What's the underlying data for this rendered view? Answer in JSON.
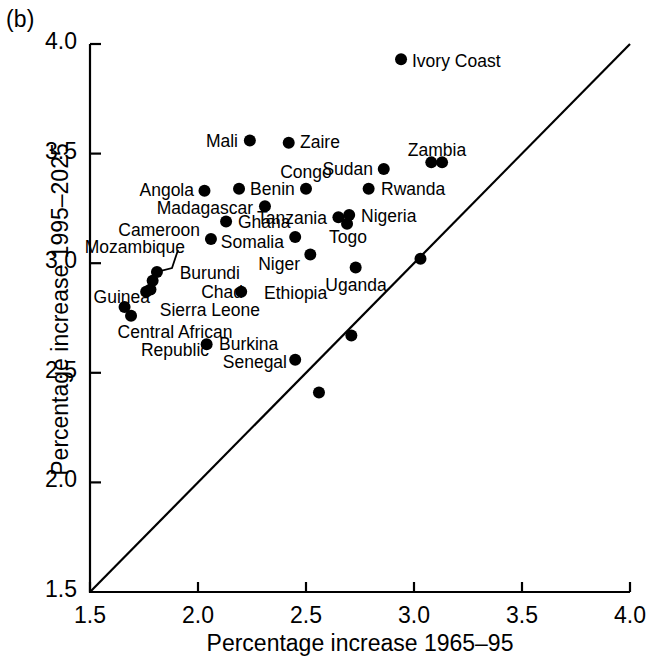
{
  "figure": {
    "panel_tag": "(b)",
    "xlabel": "Percentage increase 1965–95",
    "ylabel": "Percentage increase 1995–2025",
    "line_note": "1:1 diagonal reference line"
  },
  "axes": {
    "x_ticks": [
      "1.5",
      "2.0",
      "2.5",
      "3.0",
      "3.5",
      "4.0"
    ],
    "y_ticks": [
      "1.5",
      "2.0",
      "2.5",
      "3.0",
      "3.5",
      "4.0"
    ]
  },
  "chart_data": {
    "type": "scatter",
    "title": "",
    "xlabel": "Percentage increase 1965–95",
    "ylabel": "Percentage increase 1995–2025",
    "xlim": [
      1.5,
      4.0
    ],
    "ylim": [
      1.5,
      4.0
    ],
    "xticks": [
      1.5,
      2.0,
      2.5,
      3.0,
      3.5,
      4.0
    ],
    "yticks": [
      1.5,
      2.0,
      2.5,
      3.0,
      3.5,
      4.0
    ],
    "grid": false,
    "legend": "none",
    "reference_line": {
      "type": "identity",
      "from": [
        1.5,
        1.5
      ],
      "to": [
        4.0,
        4.0
      ]
    },
    "marker": {
      "shape": "circle",
      "color": "#000000",
      "size": 9
    },
    "points": [
      {
        "label": "Ivory Coast",
        "x": 2.94,
        "y": 3.93,
        "lx": 412,
        "ly": 52,
        "align": "left"
      },
      {
        "label": "Mali",
        "x": 2.24,
        "y": 3.56,
        "lx": 238,
        "ly": 132,
        "align": "right"
      },
      {
        "label": "Zaire",
        "x": 2.42,
        "y": 3.55,
        "lx": 300,
        "ly": 133,
        "align": "left"
      },
      {
        "label": "Zambia",
        "x": 3.08,
        "y": 3.46,
        "lx": 437,
        "ly": 141,
        "align": "center"
      },
      {
        "label": "",
        "x": 3.13,
        "y": 3.46,
        "lx": null,
        "ly": null,
        "align": "left"
      },
      {
        "label": "Sudan",
        "x": 2.86,
        "y": 3.43,
        "lx": 373,
        "ly": 160,
        "align": "right"
      },
      {
        "label": "Congo",
        "x": 2.5,
        "y": 3.34,
        "lx": 306,
        "ly": 163,
        "align": "center"
      },
      {
        "label": "Benin",
        "x": 2.19,
        "y": 3.34,
        "lx": 250,
        "ly": 180,
        "align": "left"
      },
      {
        "label": "Angola",
        "x": 2.03,
        "y": 3.33,
        "lx": 194,
        "ly": 181,
        "align": "right"
      },
      {
        "label": "Rwanda",
        "x": 2.79,
        "y": 3.34,
        "lx": 381,
        "ly": 180,
        "align": "left"
      },
      {
        "label": "Madagascar",
        "x": 2.31,
        "y": 3.26,
        "lx": 253,
        "ly": 199,
        "align": "right"
      },
      {
        "label": "Tanzania",
        "x": 2.65,
        "y": 3.21,
        "lx": 327,
        "ly": 209,
        "align": "right"
      },
      {
        "label": "Nigeria",
        "x": 2.7,
        "y": 3.22,
        "lx": 361,
        "ly": 207,
        "align": "left"
      },
      {
        "label": "Togo",
        "x": 2.69,
        "y": 3.18,
        "lx": 348,
        "ly": 228,
        "align": "center"
      },
      {
        "label": "Ghana",
        "x": 2.13,
        "y": 3.19,
        "lx": 238,
        "ly": 213,
        "align": "left"
      },
      {
        "label": "Somalia",
        "x": 2.45,
        "y": 3.12,
        "lx": 284,
        "ly": 233,
        "align": "right"
      },
      {
        "label": "Cameroon",
        "x": 2.06,
        "y": 3.11,
        "lx": 200,
        "ly": 221,
        "align": "right"
      },
      {
        "label": "Niger",
        "x": 2.52,
        "y": 3.04,
        "lx": 300,
        "ly": 255,
        "align": "right"
      },
      {
        "label": "Uganda",
        "x": 2.73,
        "y": 2.98,
        "lx": 356,
        "ly": 276,
        "align": "center"
      },
      {
        "label": "",
        "x": 3.03,
        "y": 3.02,
        "lx": null,
        "ly": null,
        "align": "left"
      },
      {
        "label": "Mozambique",
        "x": 1.81,
        "y": 2.96,
        "lx": 185,
        "ly": 238,
        "align": "right",
        "leader": [
          [
            178,
            250
          ],
          [
            172,
            268
          ]
        ]
      },
      {
        "label": "Burundi",
        "x": 1.79,
        "y": 2.92,
        "lx": 240,
        "ly": 264,
        "align": "right"
      },
      {
        "label": "Chad",
        "x": 1.78,
        "y": 2.88,
        "lx": 243,
        "ly": 283,
        "align": "right"
      },
      {
        "label": "Sierra Leone",
        "x": 1.76,
        "y": 2.87,
        "lx": 260,
        "ly": 301,
        "align": "right"
      },
      {
        "label": "Ethiopia",
        "x": 2.2,
        "y": 2.87,
        "lx": 264,
        "ly": 284,
        "align": "left"
      },
      {
        "label": "Guinea",
        "x": 1.66,
        "y": 2.8,
        "lx": 150,
        "ly": 288,
        "align": "right"
      },
      {
        "label": "Central African Republic",
        "x": 1.69,
        "y": 2.76,
        "lx": 150,
        "ly": 323,
        "align": "center"
      },
      {
        "label": "Burkina",
        "x": 2.04,
        "y": 2.63,
        "lx": 219,
        "ly": 335,
        "align": "left"
      },
      {
        "label": "Senegal",
        "x": 2.45,
        "y": 2.56,
        "lx": 287,
        "ly": 353,
        "align": "right"
      },
      {
        "label": "",
        "x": 2.71,
        "y": 2.67,
        "lx": null,
        "ly": null,
        "align": "left"
      },
      {
        "label": "",
        "x": 2.56,
        "y": 2.41,
        "lx": null,
        "ly": null,
        "align": "left"
      }
    ]
  }
}
